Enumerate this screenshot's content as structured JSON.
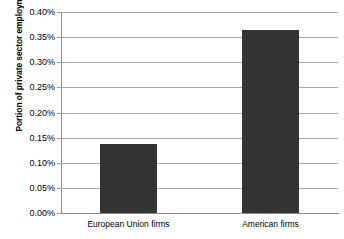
{
  "chart_data": {
    "type": "bar",
    "title": "",
    "xlabel": "",
    "ylabel": "Portion of private sector employment",
    "categories": [
      "European Union firms",
      "American firms"
    ],
    "values": [
      0.137,
      0.365
    ],
    "value_unit": "%",
    "ylim": [
      0.0,
      0.4
    ],
    "ytick_values": [
      0.0,
      0.05,
      0.1,
      0.15,
      0.2,
      0.25,
      0.3,
      0.35,
      0.4
    ],
    "ytick_labels": [
      "0.00%",
      "0.05%",
      "0.10%",
      "0.15%",
      "0.20%",
      "0.25%",
      "0.30%",
      "0.35%",
      "0.40%"
    ],
    "grid": "horizontal",
    "legend": "none",
    "bar_color": "#333333",
    "gridline_color": "#a8a8a8",
    "axis_color": "#8c8c8c",
    "background_color": "#ffffff"
  },
  "axis": {
    "y_title": "Portion of private sector employment"
  }
}
